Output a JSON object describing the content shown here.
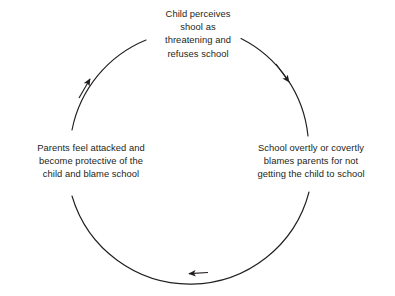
{
  "diagram": {
    "type": "cyclical-flow",
    "direction": "counterclockwise",
    "stroke_color": "#231f20",
    "text_color": "#231f20",
    "background_color": "#ffffff",
    "circle": {
      "center_x": 197,
      "center_y": 151,
      "radius": 123
    },
    "nodes": [
      {
        "id": "child",
        "position": "top",
        "text": "Child perceives\nshool as\nthreatening and\nrefuses school"
      },
      {
        "id": "school",
        "position": "right",
        "text": "School overtly or covertly\nblames parents for not\ngetting the child to school"
      },
      {
        "id": "parents",
        "position": "left",
        "text": "Parents feel attacked and\nbecome protective of the\nchild and blame school"
      }
    ],
    "arrows": [
      {
        "id": "arrow-top-right",
        "from": "child",
        "to": "school",
        "points": "down-right",
        "x": 287,
        "y": 80
      },
      {
        "id": "arrow-bottom",
        "from": "school",
        "to": "parents",
        "points": "left",
        "x": 190,
        "y": 273
      },
      {
        "id": "arrow-top-left",
        "from": "parents",
        "to": "child",
        "points": "up-right",
        "x": 89,
        "y": 80
      }
    ]
  }
}
